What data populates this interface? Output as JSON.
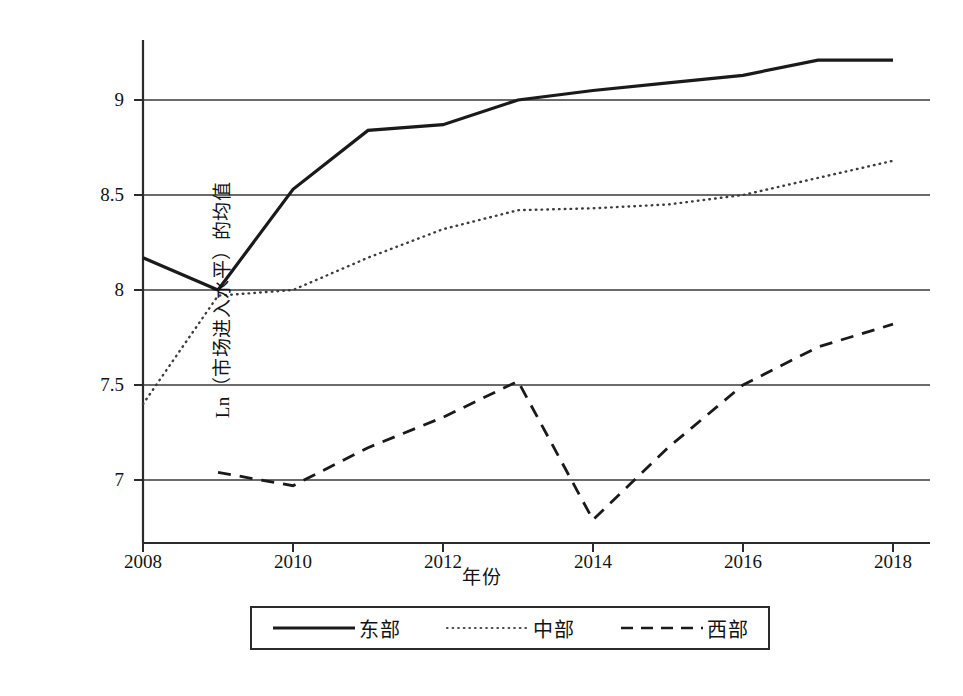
{
  "chart_data": {
    "type": "line",
    "title": "",
    "xlabel": "年份",
    "ylabel": "Ln（市场进入水平）的均值",
    "x": [
      2008,
      2009,
      2010,
      2011,
      2012,
      2013,
      2014,
      2015,
      2016,
      2017,
      2018
    ],
    "xlim": [
      2008,
      2018
    ],
    "ylim": [
      6.72,
      9.32
    ],
    "xticks": [
      "2008",
      "2010",
      "2012",
      "2014",
      "2016",
      "2018"
    ],
    "xtick_values": [
      2008,
      2010,
      2012,
      2014,
      2016,
      2018
    ],
    "yticks": [
      "7",
      "7.5",
      "8",
      "8.5",
      "9"
    ],
    "ytick_values": [
      7,
      7.5,
      8,
      8.5,
      9
    ],
    "grid": "horizontal",
    "legend_position": "below-center",
    "series": [
      {
        "name": "东部",
        "style": "solid",
        "color": "#1a1a1a",
        "x": [
          2008,
          2009,
          2010,
          2011,
          2012,
          2013,
          2014,
          2015,
          2016,
          2017,
          2018
        ],
        "values": [
          8.17,
          8.0,
          8.53,
          8.84,
          8.87,
          9.0,
          9.05,
          9.09,
          9.13,
          9.21,
          9.21
        ]
      },
      {
        "name": "中部",
        "style": "dotted",
        "color": "#3c3c3c",
        "x": [
          2008,
          2009,
          2010,
          2011,
          2012,
          2013,
          2014,
          2015,
          2016,
          2017,
          2018
        ],
        "values": [
          7.4,
          7.97,
          8.0,
          8.17,
          8.32,
          8.42,
          8.43,
          8.45,
          8.5,
          8.59,
          8.68
        ]
      },
      {
        "name": "西部",
        "style": "dashed",
        "color": "#1a1a1a",
        "x": [
          2009,
          2010,
          2011,
          2012,
          2013,
          2014,
          2015,
          2016,
          2017,
          2018
        ],
        "values": [
          7.04,
          6.97,
          7.17,
          7.33,
          7.52,
          6.79,
          7.17,
          7.5,
          7.7,
          7.82
        ]
      }
    ]
  },
  "legend": {
    "items": [
      {
        "label": "东部",
        "style": "solid"
      },
      {
        "label": "中部",
        "style": "dotted"
      },
      {
        "label": "西部",
        "style": "dashed"
      }
    ]
  },
  "axes": {
    "y_title": "Ln（市场进入水平）的均值",
    "x_title": "年份",
    "y_tick_labels": [
      "9",
      "8.5",
      "8",
      "7.5",
      "7"
    ],
    "x_tick_labels": [
      "2008",
      "2010",
      "2012",
      "2014",
      "2016",
      "2018"
    ]
  }
}
